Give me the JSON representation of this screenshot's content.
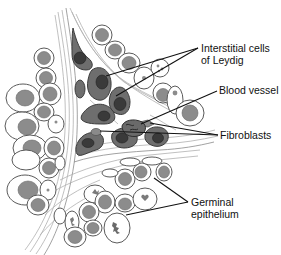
{
  "diagram": {
    "labels": [
      {
        "id": "leydig",
        "lines": [
          "Interstitial cells",
          "of Leydig"
        ]
      },
      {
        "id": "blood_vessel",
        "lines": [
          "Blood vessel"
        ]
      },
      {
        "id": "fibroblasts",
        "lines": [
          "Fibroblasts"
        ]
      },
      {
        "id": "germinal",
        "lines": [
          "Germinal",
          "epithelium"
        ]
      }
    ],
    "colors": {
      "background": "#ffffff",
      "leydig_cell": "#6e6e6e",
      "leydig_nucleus": "#3a3a3a",
      "germ_cell_nucleus": "#8c8c8c",
      "connective_fiber": "#b0b0b0",
      "leader_line": "#111111"
    }
  }
}
